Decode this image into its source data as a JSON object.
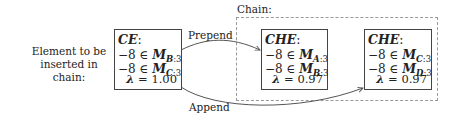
{
  "left_label": {
    "line1": "Element to be",
    "line2": "inserted in chain:"
  },
  "chain_label": "Chain:",
  "edges": {
    "prepend": "Prepend",
    "append": "Append"
  },
  "nodes": [
    {
      "id": "CE",
      "title": "CE",
      "colon": ":",
      "lines": [
        {
          "value": "−8 ∈ ",
          "M": "M",
          "sub_bold": "B",
          "sub_rest": ":3"
        },
        {
          "value": "−8 ∈ ",
          "M": "M",
          "sub_bold": "C",
          "sub_rest": ":3"
        }
      ],
      "lambda_symbol": "λ",
      "lambda_text": " = 1.00"
    },
    {
      "id": "CHE1",
      "title": "CHE",
      "colon": ":",
      "lines": [
        {
          "value": "−8 ∈ ",
          "M": "M",
          "sub_bold": "A",
          "sub_rest": ":3"
        },
        {
          "value": "−8 ∈ ",
          "M": "M",
          "sub_bold": "B",
          "sub_rest": ":3"
        }
      ],
      "lambda_symbol": "λ",
      "lambda_text": " = 0.97"
    },
    {
      "id": "CHE2",
      "title": "CHE",
      "colon": ":",
      "lines": [
        {
          "value": "−8 ∈ ",
          "M": "M",
          "sub_bold": "C",
          "sub_rest": ":3"
        },
        {
          "value": "−8 ∈ ",
          "M": "M",
          "sub_bold": "D",
          "sub_rest": ":3"
        }
      ],
      "lambda_symbol": "λ",
      "lambda_text": " = 0.97"
    }
  ],
  "colors": {
    "box_border": "#444444",
    "chain_border": "#999999",
    "arrow": "#555555"
  }
}
